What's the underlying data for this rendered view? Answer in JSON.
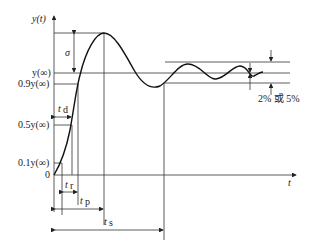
{
  "diagram": {
    "y_axis_label": "y(t)",
    "x_axis_label": "t",
    "levels": {
      "final": "y(∞)",
      "ninety": "0.9y(∞)",
      "fifty": "0.5y(∞)",
      "ten": "0.1y(∞)",
      "zero": "0"
    },
    "annotations": {
      "overshoot": "σ",
      "delay_time": "t",
      "delay_sub": "d",
      "rise_time": "t",
      "rise_sub": "r",
      "peak_time": "t",
      "peak_sub": "p",
      "settling_time": "t",
      "settling_sub": "s",
      "tolerance": "2% 或 5%"
    }
  }
}
